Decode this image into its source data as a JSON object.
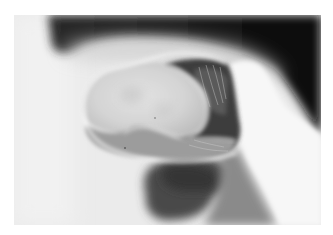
{
  "image": {
    "type": "grayscale radiograph",
    "description": "Double-contrast barium X-ray showing a lobulated rounded filling mass outlined by a thin white contrast rim, with a bright contrast-filled bowel loop on the right, dark gas region top-right and a dark shadow below",
    "colors": {
      "background": "#ffffff",
      "field": "#ececec",
      "dark_gas": "#0d0d0d",
      "mid_gray": "#8a8a8a",
      "shadow": "#4a4a4a",
      "bright_contrast": "#f7f7f7"
    }
  }
}
